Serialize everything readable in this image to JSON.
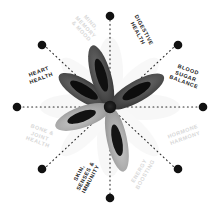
{
  "figure": {
    "type": "radial-spoke-diagram",
    "background_color": "#ffffff",
    "center_graphic": {
      "name": "botanical-seed-pod-illustration",
      "petal_count": 5,
      "petal_color_dark": "#3c3c3c",
      "petal_color_mid": "#8f8f8f",
      "petal_color_light": "#b9b9b9",
      "seed_color": "#111111",
      "hub_color": "#101010",
      "watermark_color": "#efefef"
    },
    "spoke_count": 8,
    "spoke_style": "dotted",
    "spoke_color": "#2b2b2b",
    "endpoint_dot_color": "#111111",
    "endpoint_dot_radius": 4.2,
    "center": {
      "x": 110,
      "y": 107
    },
    "spoke_length": 91
  },
  "spokes": [
    {
      "id": "mind-memory-mood",
      "label": "MIND,\nMEMORY\n& MOOD",
      "angle_deg": 225,
      "emphasis": "faded",
      "color": "#d8d8d8",
      "label_x": 86,
      "label_y": 31,
      "label_rotation": 47
    },
    {
      "id": "digestive-health",
      "label": "DIGESTIVE\nHEALTH",
      "angle_deg": 293,
      "emphasis": "dark",
      "color": "#1b1b1b",
      "label_x": 141,
      "label_y": 36,
      "label_rotation": 62
    },
    {
      "id": "blood-sugar-balance",
      "label": "BLOOD\nSUGAR\nBALANCE",
      "angle_deg": 337,
      "emphasis": "dark",
      "color": "#1b1b1b",
      "label_x": 186,
      "label_y": 79,
      "label_rotation": 20
    },
    {
      "id": "hormone-harmony",
      "label": "HORMONE\nHARMONY",
      "angle_deg": 22,
      "emphasis": "faded",
      "color": "#d8d8d8",
      "label_x": 184,
      "label_y": 137,
      "label_rotation": -20
    },
    {
      "id": "energy-boosting",
      "label": "ENERGY\nBOOSTING",
      "angle_deg": 67,
      "emphasis": "faded",
      "color": "#d8d8d8",
      "label_x": 142,
      "label_y": 177,
      "label_rotation": -60
    },
    {
      "id": "skin-senses-immunity",
      "label": "SKIN,\nSENSES &\nIMMUNITY",
      "angle_deg": 113,
      "emphasis": "dark",
      "color": "#1b1b1b",
      "label_x": 85,
      "label_y": 180,
      "label_rotation": -62
    },
    {
      "id": "bone-joint-health",
      "label": "BONE &\nJOINT\nHEALTH",
      "angle_deg": 157,
      "emphasis": "faded",
      "color": "#d8d8d8",
      "label_x": 40,
      "label_y": 137,
      "label_rotation": 20
    },
    {
      "id": "heart-health",
      "label": "HEART\nHEALTH",
      "angle_deg": 202,
      "emphasis": "dark",
      "color": "#1b1b1b",
      "label_x": 40,
      "label_y": 78,
      "label_rotation": -20
    }
  ]
}
